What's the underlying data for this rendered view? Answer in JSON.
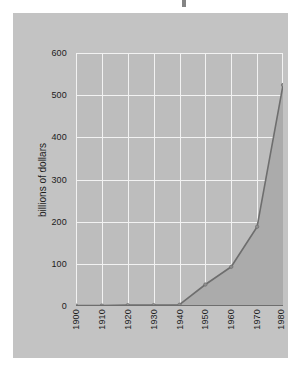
{
  "figure": {
    "background_color": "#ffffff",
    "panel_color": "#c3c3c3",
    "plot_background_color": "#bdbdbd",
    "gridline_color": "#f2f2f2",
    "title_fragment": ""
  },
  "chart_data": {
    "type": "area",
    "title": "",
    "xlabel": "",
    "ylabel": "billions of dollars",
    "x": [
      1900,
      1910,
      1920,
      1930,
      1940,
      1950,
      1960,
      1970,
      1980
    ],
    "categories": [
      "1900",
      "1910",
      "1920",
      "1930",
      "1940",
      "1950",
      "1960",
      "1970",
      "1980"
    ],
    "values": [
      1,
      1,
      2,
      2,
      3,
      51,
      93,
      188,
      524
    ],
    "series": [
      {
        "name": "billions of dollars",
        "values": [
          1,
          1,
          2,
          2,
          3,
          51,
          93,
          188,
          524
        ]
      }
    ],
    "xlim": [
      1900,
      1980
    ],
    "ylim": [
      0,
      600
    ],
    "ytick_values": [
      0,
      100,
      200,
      300,
      400,
      500,
      600
    ],
    "ytick_labels": [
      "0",
      "100",
      "200",
      "300",
      "400",
      "500",
      "600"
    ],
    "xtick_labels": [
      "1900",
      "1910",
      "1920",
      "1930",
      "1940",
      "1950",
      "1960",
      "1970",
      "1980"
    ],
    "grid": true,
    "legend": false,
    "legend_position": "none",
    "line_color": "#6e6e6e",
    "fill_color": "#ababab",
    "marker": "circle",
    "marker_color": "#8f8f8f"
  }
}
